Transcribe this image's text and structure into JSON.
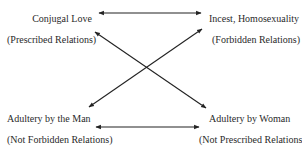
{
  "nodes": {
    "top_left": {
      "title": "Conjugal Love",
      "subtitle": "(Prescribed Relations)"
    },
    "top_right": {
      "title": "Incest, Homosexuality",
      "subtitle": "(Forbidden Relations)"
    },
    "bottom_left": {
      "title": "Adultery by the Man",
      "subtitle": "(Not Forbidden Relations)"
    },
    "bottom_right": {
      "title": "Adultery by Woman",
      "subtitle": "(Not Prescribed Relations)"
    }
  },
  "edges": [
    {
      "from": "top_left",
      "to": "top_right",
      "type": "double-arrow"
    },
    {
      "from": "bottom_left",
      "to": "bottom_right",
      "type": "double-arrow"
    },
    {
      "from": "top_left",
      "to": "bottom_right",
      "type": "double-arrow"
    },
    {
      "from": "bottom_left",
      "to": "top_right",
      "type": "double-arrow"
    }
  ],
  "colors": {
    "line": "#222222",
    "text": "#2a2a2a",
    "background": "#ffffff"
  }
}
